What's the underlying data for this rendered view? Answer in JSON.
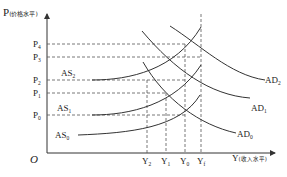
{
  "diagram": {
    "axes": {
      "y_label": "P",
      "y_label_note": "(价格水平)",
      "x_label": "Y",
      "x_label_note": "(收入水平)",
      "origin": "O"
    },
    "price_levels": [
      {
        "name": "P",
        "sub": "4"
      },
      {
        "name": "P",
        "sub": "3"
      },
      {
        "name": "P",
        "sub": "2"
      },
      {
        "name": "P",
        "sub": "1"
      },
      {
        "name": "P",
        "sub": "0"
      }
    ],
    "output_levels": [
      {
        "name": "Y",
        "sub": "2"
      },
      {
        "name": "Y",
        "sub": "1"
      },
      {
        "name": "Y",
        "sub": "0"
      },
      {
        "name": "Y",
        "sub": "f"
      }
    ],
    "as_curves": [
      {
        "name": "AS",
        "sub": "2"
      },
      {
        "name": "AS",
        "sub": "1"
      },
      {
        "name": "AS",
        "sub": "0"
      }
    ],
    "ad_curves": [
      {
        "name": "AD",
        "sub": "2"
      },
      {
        "name": "AD",
        "sub": "1"
      },
      {
        "name": "AD",
        "sub": "0"
      }
    ],
    "colors": {
      "line": "#333333",
      "dash": "#555555"
    }
  }
}
